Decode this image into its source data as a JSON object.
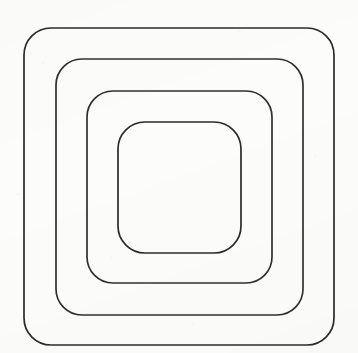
{
  "document": {
    "kind": "line-drawing",
    "title": "Nested rounded squares",
    "width": 358,
    "height": 353,
    "background_color": "#fcfcfb",
    "texture": "faint-scanned-paper"
  },
  "figure": {
    "name": "concentric-rounded-squares",
    "shape_count": 4,
    "stroke_color": "#2b2b2b",
    "fill": "none",
    "nesting": "concentric",
    "shapes": [
      {
        "id": "ring-1",
        "label": "outermost rounded square",
        "order": 1,
        "x": 24,
        "y": 28,
        "width": 310,
        "height": 317,
        "corner_radius": 27,
        "stroke_width": 1.7,
        "stroke_color": "#2b2b2b"
      },
      {
        "id": "ring-2",
        "label": "second rounded square",
        "order": 2,
        "x": 56,
        "y": 59,
        "width": 247,
        "height": 256,
        "corner_radius": 26,
        "stroke_width": 1.7,
        "stroke_color": "#2f2f2f"
      },
      {
        "id": "ring-3",
        "label": "third rounded square",
        "order": 3,
        "x": 87,
        "y": 91,
        "width": 185,
        "height": 192,
        "corner_radius": 26,
        "stroke_width": 1.7,
        "stroke_color": "#2f2f2f"
      },
      {
        "id": "ring-4",
        "label": "innermost rounded square",
        "order": 4,
        "x": 118,
        "y": 122,
        "width": 123,
        "height": 131,
        "corner_radius": 27,
        "stroke_width": 1.7,
        "stroke_color": "#2b2b2b"
      }
    ]
  }
}
